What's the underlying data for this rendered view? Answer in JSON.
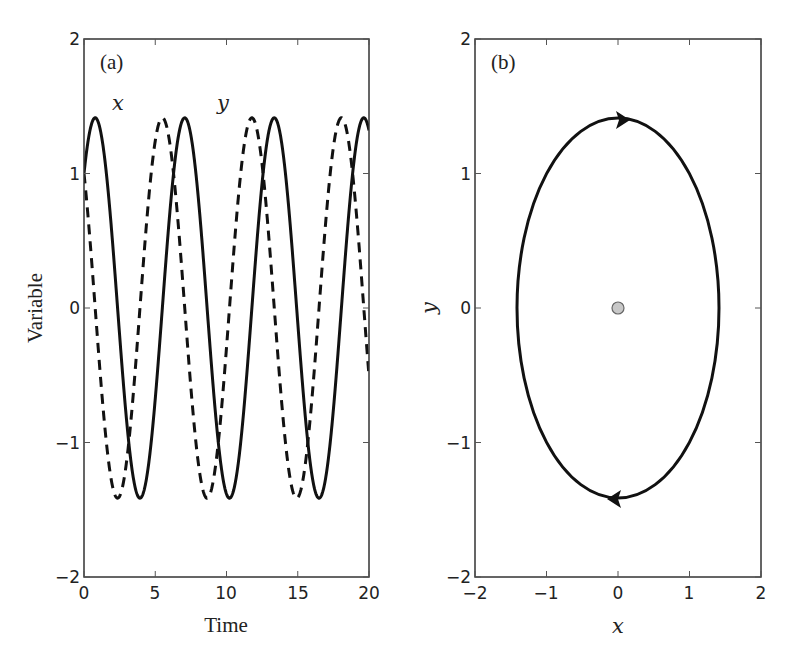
{
  "chart_data": [
    {
      "panel": "(a)",
      "type": "line",
      "title": "",
      "xlabel": "Time",
      "ylabel": "Variable",
      "xlim": [
        0,
        20
      ],
      "ylim": [
        -2,
        2
      ],
      "xticks": [
        0,
        5,
        10,
        15,
        20
      ],
      "yticks": [
        -2,
        -1,
        0,
        1,
        2
      ],
      "grid": false,
      "annotations": [
        {
          "text": "(a)",
          "x": 1.1,
          "y": 1.82
        },
        {
          "text": "x",
          "x": 2.5,
          "y": 1.52
        },
        {
          "text": "y",
          "x": 9.9,
          "y": 1.52
        }
      ],
      "series": [
        {
          "name": "x",
          "style": "solid",
          "formula": "sqrt(2)*sin(t+pi/4)",
          "amplitude": 1.414,
          "period": 6.283,
          "x0_value": 1.0,
          "sample_t": [
            0,
            0.785,
            2.356,
            3.927,
            5.498,
            7.069,
            8.639,
            10.21,
            11.78,
            13.35,
            14.92,
            16.49,
            18.06,
            19.63,
            20
          ],
          "sample_values": [
            1.0,
            1.414,
            0,
            -1.414,
            0,
            1.414,
            0,
            -1.414,
            0,
            1.414,
            0,
            -1.414,
            0,
            1.414,
            1.32
          ]
        },
        {
          "name": "y",
          "style": "dashed",
          "formula": "sqrt(2)*cos(t+pi/4)",
          "amplitude": 1.414,
          "period": 6.283,
          "x0_value": 1.0,
          "sample_t": [
            0,
            0.785,
            2.356,
            3.927,
            5.498,
            7.069,
            8.639,
            10.21,
            11.78,
            13.35,
            14.92,
            16.49,
            18.06,
            19.63,
            20
          ],
          "sample_values": [
            1.0,
            0,
            -1.414,
            0,
            1.414,
            0,
            -1.414,
            0,
            1.414,
            0,
            -1.414,
            0,
            1.414,
            0,
            -0.5
          ]
        }
      ]
    },
    {
      "panel": "(b)",
      "type": "line",
      "title": "",
      "xlabel": "x",
      "ylabel": "y",
      "xlim": [
        -2,
        2
      ],
      "ylim": [
        -2,
        2
      ],
      "xticks": [
        -2,
        -1,
        0,
        1,
        2
      ],
      "yticks": [
        -2,
        -1,
        0,
        1,
        2
      ],
      "grid": false,
      "annotations": [
        {
          "text": "(b)",
          "x": -1.62,
          "y": 1.82
        }
      ],
      "series": [
        {
          "name": "orbit",
          "style": "solid",
          "shape": "circle",
          "center": [
            0,
            0
          ],
          "radius": 1.414,
          "direction": "clockwise",
          "arrows": [
            {
              "at": [
                0,
                1.414
              ],
              "pointing": "right"
            },
            {
              "at": [
                0,
                -1.414
              ],
              "pointing": "left"
            }
          ]
        },
        {
          "name": "fixed point",
          "style": "marker",
          "x": [
            0
          ],
          "y": [
            0
          ],
          "color": "#c8c8c8"
        }
      ]
    }
  ],
  "panels": {
    "a": {
      "label": "(a)",
      "xlabel": "Time",
      "ylabel": "Variable",
      "curve_labels": {
        "x": "x",
        "y": "y"
      },
      "xtick_labels": [
        "0",
        "5",
        "10",
        "15",
        "20"
      ],
      "ytick_labels": [
        "2",
        "1",
        "0",
        "−1",
        "−2"
      ]
    },
    "b": {
      "label": "(b)",
      "xlabel": "x",
      "ylabel": "y",
      "xtick_labels": [
        "−2",
        "−1",
        "0",
        "1",
        "2"
      ],
      "ytick_labels": [
        "2",
        "1",
        "0",
        "−1",
        "−2"
      ]
    }
  },
  "colors": {
    "line": "#111111",
    "fixed_point_fill": "#c8c8c8",
    "fixed_point_stroke": "#666666"
  }
}
